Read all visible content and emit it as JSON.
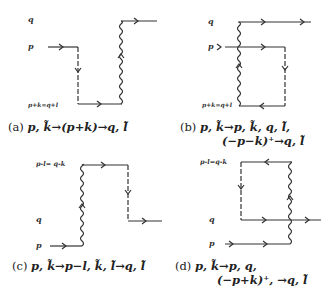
{
  "figure": {
    "panels": [
      {
        "id": "a",
        "labels": {
          "top": "q",
          "mid": "p",
          "bottom": "p+k=q+l"
        },
        "caption_tag": "(a)",
        "caption_line1": "p, k̃→(p+k)→q, l̃",
        "caption_line2": ""
      },
      {
        "id": "b",
        "labels": {
          "top": "q",
          "mid": "p",
          "bottom": "p+k=q+l"
        },
        "caption_tag": "(b)",
        "caption_line1": "p, k̃→p, k̃, q, l̃,",
        "caption_line2": "(−p−k)⁺→q, l̃"
      },
      {
        "id": "c",
        "labels": {
          "top": "p-l= q-k",
          "mid": "q",
          "bottom": "p"
        },
        "caption_tag": "(c)",
        "caption_line1": "p, k̃→p−l, k̃, l̃→q, l̃",
        "caption_line2": ""
      },
      {
        "id": "d",
        "labels": {
          "top": "p-l=q-k",
          "mid": "q",
          "bottom": "p"
        },
        "caption_tag": "(d)",
        "caption_line1": "p, k̃→p, q,",
        "caption_line2": "(−p+k)⁺, →q, l̃"
      }
    ],
    "colors": {
      "ink": "#333333",
      "background": "#ffffff"
    }
  }
}
